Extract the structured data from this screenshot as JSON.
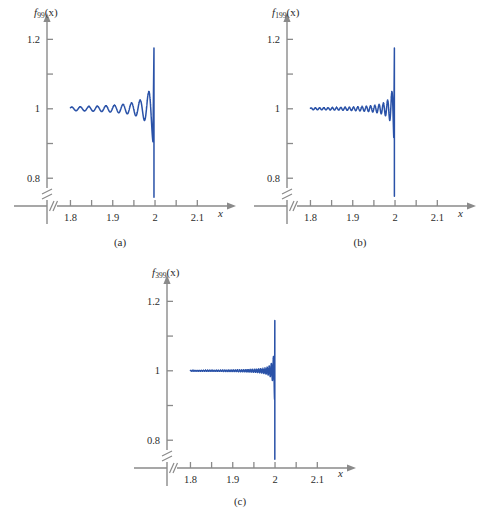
{
  "figure": {
    "background": "#ffffff",
    "curve_color": "#2a52a8",
    "axis_color": "#8a8a8a",
    "text_color": "#2b2b2b"
  },
  "panels": [
    {
      "id": "a",
      "caption": "(a)",
      "y_axis_label_base": "f",
      "y_axis_label_sub": "99",
      "y_axis_label_arg": "(x)",
      "x_axis_name": "x",
      "y_ticks": [
        "0.8",
        "",
        "1",
        "",
        "1.2"
      ],
      "y_tick_values": [
        0.8,
        0.9,
        1.0,
        1.1,
        1.2
      ],
      "x_ticks": [
        "1.8",
        "",
        "1.9",
        "",
        "2",
        "",
        "2.1"
      ],
      "x_tick_values": [
        1.8,
        1.85,
        1.9,
        1.95,
        2.0,
        2.05,
        2.1
      ]
    },
    {
      "id": "b",
      "caption": "(b)",
      "y_axis_label_base": "f",
      "y_axis_label_sub": "199",
      "y_axis_label_arg": "(x)",
      "x_axis_name": "x",
      "y_ticks": [
        "0.8",
        "",
        "1",
        "",
        "1.2"
      ],
      "y_tick_values": [
        0.8,
        0.9,
        1.0,
        1.1,
        1.2
      ],
      "x_ticks": [
        "1.8",
        "",
        "1.9",
        "",
        "2",
        "",
        "2.1"
      ],
      "x_tick_values": [
        1.8,
        1.85,
        1.9,
        1.95,
        2.0,
        2.05,
        2.1
      ]
    },
    {
      "id": "c",
      "caption": "(c)",
      "y_axis_label_base": "f",
      "y_axis_label_sub": "399",
      "y_axis_label_arg": "(x)",
      "x_axis_name": "x",
      "y_ticks": [
        "0.8",
        "",
        "1",
        "",
        "1.2"
      ],
      "y_tick_values": [
        0.8,
        0.9,
        1.0,
        1.1,
        1.2
      ],
      "x_ticks": [
        "1.8",
        "",
        "1.9",
        "",
        "2",
        "",
        "2.1"
      ],
      "x_tick_values": [
        1.8,
        1.85,
        1.9,
        1.95,
        2.0,
        2.05,
        2.1
      ]
    }
  ],
  "chart_data": {
    "type": "line",
    "title": "",
    "xlabel": "x",
    "ylabel": "f_N(x)",
    "xlim": [
      1.78,
      2.13
    ],
    "ylim": [
      0.72,
      1.25
    ],
    "x_axis_broken": true,
    "y_axis_broken": true,
    "grid": false,
    "legend": "none",
    "xticks": [
      1.8,
      1.85,
      1.9,
      1.95,
      2.0,
      2.05,
      2.1
    ],
    "xticklabels": [
      "1.8",
      "",
      "1.9",
      "",
      "2",
      "",
      "2.1"
    ],
    "yticks": [
      0.8,
      0.9,
      1.0,
      1.1,
      1.2
    ],
    "yticklabels": [
      "0.8",
      "",
      "1",
      "",
      "1.2"
    ],
    "series": [
      {
        "name": "f_99(x)",
        "panel": "a",
        "N": 99,
        "baseline": 1.0,
        "jump_x": 2.0,
        "peak_overshoot": 1.175,
        "min_before_drop": 0.905,
        "drop_bottom": 0.745,
        "initial_amplitude_at_1p8": 0.022,
        "x_start": 1.8,
        "x_end": 1.995,
        "visible_oscillation_count": 13
      },
      {
        "name": "f_199(x)",
        "panel": "b",
        "N": 199,
        "baseline": 1.0,
        "jump_x": 2.0,
        "peak_overshoot": 1.175,
        "min_before_drop": 0.905,
        "drop_bottom": 0.748,
        "initial_amplitude_at_1p8": 0.012,
        "x_start": 1.8,
        "x_end": 1.997,
        "visible_oscillation_count": 26
      },
      {
        "name": "f_399(x)",
        "panel": "c",
        "N": 399,
        "baseline": 1.0,
        "jump_x": 2.0,
        "peak_overshoot": 1.145,
        "min_before_drop": 0.905,
        "drop_bottom": 0.745,
        "initial_amplitude_at_1p8": 0.006,
        "x_start": 1.8,
        "x_end": 1.999,
        "visible_oscillation_count": 52
      }
    ]
  }
}
